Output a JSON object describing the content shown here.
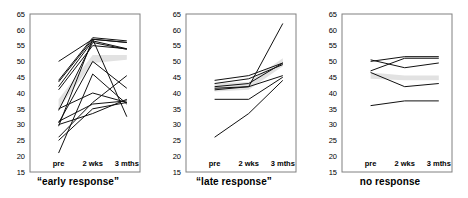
{
  "figure": {
    "name": "three-panel-response-trajectories",
    "axis": {
      "y_ticks": [
        65,
        60,
        55,
        50,
        45,
        40,
        35,
        30,
        25,
        20,
        15
      ],
      "ylim": [
        15,
        65
      ],
      "x_ticks": [
        "pre",
        "2 wks",
        "3 mths"
      ],
      "grid": false
    },
    "colors": {
      "line": "#111111",
      "band": "#e2e2e2",
      "frame": "#808080",
      "text": "#000000"
    }
  },
  "chart_data": [
    {
      "type": "line",
      "title": "“early response”",
      "xlabel": "",
      "ylabel": "",
      "ylim": [
        15,
        65
      ],
      "grid": false,
      "legend": "none",
      "categories": [
        "pre",
        "2 wks",
        "3 mths"
      ],
      "band": {
        "name": "mean-band",
        "upper": [
          38.0,
          52.0,
          52.0
        ],
        "lower": [
          35.0,
          49.5,
          50.5
        ]
      },
      "series": [
        {
          "name": "subject-1",
          "values": [
            44.0,
            57.5,
            56.5
          ]
        },
        {
          "name": "subject-2",
          "values": [
            43.5,
            57.0,
            56.0
          ]
        },
        {
          "name": "subject-3",
          "values": [
            50.0,
            57.0,
            56.0
          ]
        },
        {
          "name": "subject-4",
          "values": [
            42.0,
            56.5,
            54.0
          ]
        },
        {
          "name": "subject-5",
          "values": [
            41.0,
            55.0,
            54.0
          ]
        },
        {
          "name": "subject-6",
          "values": [
            34.5,
            56.0,
            53.8
          ]
        },
        {
          "name": "subject-7",
          "values": [
            30.5,
            50.0,
            41.5
          ]
        },
        {
          "name": "subject-8",
          "values": [
            29.5,
            57.0,
            32.5
          ]
        },
        {
          "name": "subject-9",
          "values": [
            26.0,
            37.0,
            45.5
          ]
        },
        {
          "name": "subject-10",
          "values": [
            25.0,
            35.0,
            37.0
          ]
        },
        {
          "name": "subject-11",
          "values": [
            21.0,
            46.0,
            36.5
          ]
        },
        {
          "name": "subject-12",
          "values": [
            31.0,
            36.5,
            37.5
          ]
        },
        {
          "name": "subject-13",
          "values": [
            30.0,
            33.5,
            38.0
          ]
        },
        {
          "name": "subject-14",
          "values": [
            35.0,
            40.0,
            37.0
          ]
        }
      ]
    },
    {
      "type": "line",
      "title": "“late response”",
      "xlabel": "",
      "ylabel": "",
      "ylim": [
        15,
        65
      ],
      "grid": false,
      "legend": "none",
      "categories": [
        "pre",
        "2 wks",
        "3 mths"
      ],
      "band": {
        "name": "mean-band",
        "upper": [
          43.0,
          43.5,
          51.0
        ],
        "lower": [
          40.5,
          41.0,
          48.5
        ]
      },
      "series": [
        {
          "name": "subject-1",
          "values": [
            44.0,
            45.5,
            49.5
          ]
        },
        {
          "name": "subject-2",
          "values": [
            43.0,
            44.5,
            49.0
          ]
        },
        {
          "name": "subject-3",
          "values": [
            42.0,
            43.0,
            49.5
          ]
        },
        {
          "name": "subject-4",
          "values": [
            41.5,
            42.0,
            62.0
          ]
        },
        {
          "name": "subject-5",
          "values": [
            41.0,
            42.0,
            45.5
          ]
        },
        {
          "name": "subject-6",
          "values": [
            38.0,
            38.0,
            45.0
          ]
        },
        {
          "name": "subject-7",
          "values": [
            26.0,
            33.5,
            44.0
          ]
        }
      ]
    },
    {
      "type": "line",
      "title": "no response",
      "xlabel": "",
      "ylabel": "",
      "ylim": [
        15,
        65
      ],
      "grid": false,
      "legend": "none",
      "categories": [
        "pre",
        "2 wks",
        "3 mths"
      ],
      "band": {
        "name": "mean-band",
        "upper": [
          46.5,
          45.5,
          45.5
        ],
        "lower": [
          44.5,
          44.0,
          44.0
        ]
      },
      "series": [
        {
          "name": "subject-1",
          "values": [
            50.5,
            48.0,
            49.5
          ]
        },
        {
          "name": "subject-2",
          "values": [
            50.0,
            51.5,
            51.5
          ]
        },
        {
          "name": "subject-3",
          "values": [
            47.0,
            51.0,
            51.0
          ]
        },
        {
          "name": "subject-4",
          "values": [
            46.5,
            42.0,
            43.0
          ]
        },
        {
          "name": "subject-5",
          "values": [
            36.0,
            37.5,
            37.5
          ]
        }
      ]
    }
  ]
}
